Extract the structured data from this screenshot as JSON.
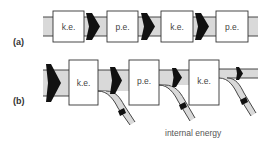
{
  "diagram": {
    "colors": {
      "band_fill": "#d9d9d9",
      "outline": "#333333",
      "box_fill": "#ffffff",
      "arrow_fill": "#111111"
    },
    "panel_a": {
      "label": "(a)",
      "boxes": [
        {
          "label": "k.e."
        },
        {
          "label": "p.e."
        },
        {
          "label": "k.e."
        },
        {
          "label": "p.e."
        }
      ]
    },
    "panel_b": {
      "label": "(b)",
      "boxes": [
        {
          "label": "k.e."
        },
        {
          "label": "p.e."
        },
        {
          "label": "k.e."
        }
      ],
      "branch_label": "internal energy"
    }
  }
}
